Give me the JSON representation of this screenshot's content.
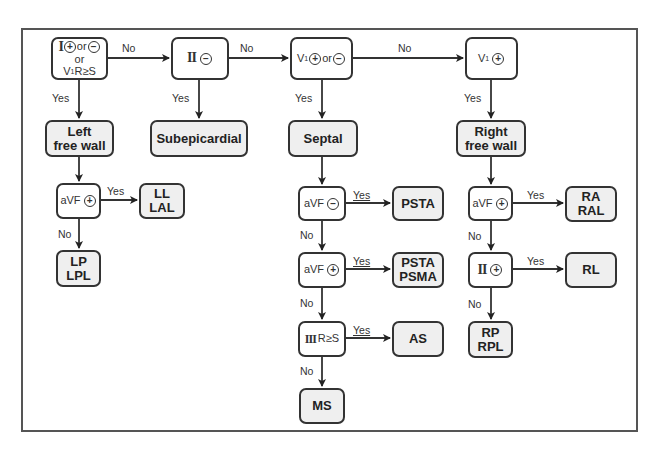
{
  "diagram": {
    "type": "flowchart",
    "topic": "ECG lead-based localization decision tree"
  },
  "decisions": {
    "d1": {
      "lead": "I",
      "sign1": "+",
      "or1": "or",
      "sign2": "−",
      "or2": "or",
      "line3_lead": "V",
      "line3_sub": "1",
      "line3_rest": "R≥S"
    },
    "d2": {
      "lead": "II",
      "sign": "−"
    },
    "d3": {
      "lead": "V",
      "sub": "1",
      "sign1": "+",
      "or": "or",
      "sign2": "−"
    },
    "d4": {
      "lead": "V",
      "sub": "1",
      "sign": "+"
    },
    "left_avf": {
      "lead": "aVF",
      "sign": "+"
    },
    "septal_avf_neg": {
      "lead": "aVF",
      "sign": "−"
    },
    "septal_avf_pos": {
      "lead": "aVF",
      "sign": "+"
    },
    "septal_iii": {
      "lead": "III",
      "rest": "R≥S"
    },
    "right_avf": {
      "lead": "aVF",
      "sign": "+"
    },
    "right_ii": {
      "lead": "II",
      "sign": "+"
    }
  },
  "results": {
    "left_free_wall": {
      "line1": "Left",
      "line2": "free wall"
    },
    "subepicardial": {
      "line1": "Subepicardial"
    },
    "septal": {
      "line1": "Septal"
    },
    "right_free_wall": {
      "line1": "Right",
      "line2": "free wall"
    },
    "ll_lal": {
      "line1": "LL",
      "line2": "LAL"
    },
    "lp_lpl": {
      "line1": "LP",
      "line2": "LPL"
    },
    "psta": {
      "line1": "PSTA"
    },
    "psta_psma": {
      "line1": "PSTA",
      "line2": "PSMA"
    },
    "as": {
      "line1": "AS"
    },
    "ms": {
      "line1": "MS"
    },
    "ra_ral": {
      "line1": "RA",
      "line2": "RAL"
    },
    "rl": {
      "line1": "RL"
    },
    "rp_rpl": {
      "line1": "RP",
      "line2": "RPL"
    }
  },
  "edge_labels": {
    "yes": "Yes",
    "no": "No"
  },
  "colors": {
    "result_fill": "#efefef",
    "condition_fill": "#ffffff",
    "stroke": "#333333",
    "frame": "#555555"
  }
}
